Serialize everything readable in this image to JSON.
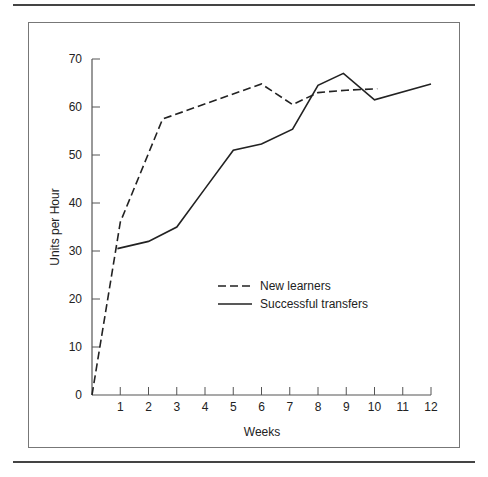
{
  "chart_data": {
    "type": "line",
    "title": "",
    "xlabel": "Weeks",
    "ylabel": "Units per Hour",
    "xlim": [
      0,
      12
    ],
    "ylim": [
      0,
      70
    ],
    "x_ticks": [
      1,
      2,
      3,
      4,
      5,
      6,
      7,
      8,
      9,
      10,
      11,
      12
    ],
    "y_ticks": [
      0,
      10,
      20,
      30,
      40,
      50,
      60,
      70
    ],
    "grid": false,
    "legend_position": "center (inside plot)",
    "series": [
      {
        "name": "New learners",
        "style": "dashed",
        "x": [
          0,
          1,
          2.5,
          6,
          7.1,
          8,
          9,
          10.1
        ],
        "y": [
          0,
          36,
          57.5,
          64.8,
          60.5,
          63,
          63.5,
          63.8
        ]
      },
      {
        "name": "Successful transfers",
        "style": "solid",
        "x": [
          0.9,
          2,
          3,
          4,
          5,
          6,
          7.1,
          8,
          8.9,
          10,
          12
        ],
        "y": [
          30.5,
          32,
          35,
          43,
          51,
          52.3,
          55.4,
          64.5,
          67,
          61.5,
          64.8
        ]
      }
    ]
  },
  "labels": {
    "xlabel": "Weeks",
    "ylabel": "Units per Hour",
    "legend": [
      "New learners",
      "Successful transfers"
    ],
    "x_tick_labels": [
      "1",
      "2",
      "3",
      "4",
      "5",
      "6",
      "7",
      "8",
      "9",
      "10",
      "11",
      "12"
    ],
    "y_tick_labels": [
      "0",
      "10",
      "20",
      "30",
      "40",
      "50",
      "60",
      "70"
    ]
  },
  "colors": {
    "line": "#222222",
    "axis": "#777777"
  }
}
